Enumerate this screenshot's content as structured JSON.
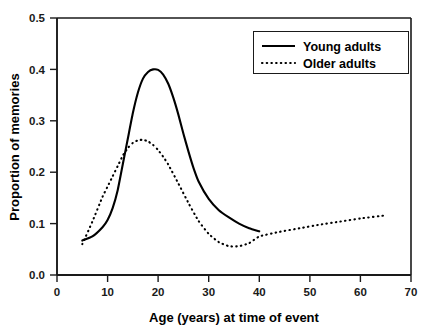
{
  "chart_data": {
    "type": "line",
    "title": "",
    "xlabel": "Age (years) at time of event",
    "ylabel": "Proportion of memories",
    "xlim": [
      0,
      70
    ],
    "ylim": [
      0.0,
      0.5
    ],
    "xticks": [
      0,
      10,
      20,
      30,
      40,
      50,
      60,
      70
    ],
    "xtick_labels": [
      "0",
      "10",
      "20",
      "30",
      "40",
      "50",
      "60",
      "70"
    ],
    "yticks": [
      0.0,
      0.1,
      0.2,
      0.3,
      0.4,
      0.5
    ],
    "ytick_labels": [
      "0.0",
      "0.1",
      "0.2",
      "0.3",
      "0.4",
      "0.5"
    ],
    "grid": false,
    "legend_position": "top-right",
    "series": [
      {
        "name": "Young adults",
        "style": "solid",
        "color": "#000000",
        "x": [
          5,
          7,
          9,
          10,
          11,
          12,
          13,
          14,
          15,
          16,
          17,
          18,
          19,
          20,
          21,
          22,
          23,
          24,
          25,
          26,
          27,
          28,
          30,
          32,
          34,
          36,
          38,
          40
        ],
        "y": [
          0.067,
          0.075,
          0.093,
          0.107,
          0.13,
          0.165,
          0.215,
          0.265,
          0.315,
          0.355,
          0.382,
          0.395,
          0.4,
          0.399,
          0.39,
          0.372,
          0.345,
          0.312,
          0.275,
          0.24,
          0.208,
          0.182,
          0.148,
          0.126,
          0.112,
          0.1,
          0.091,
          0.085
        ]
      },
      {
        "name": "Older adults",
        "style": "dotted",
        "color": "#000000",
        "x": [
          5,
          7,
          9,
          10,
          11,
          12,
          13,
          14,
          15,
          16,
          17,
          18,
          19,
          20,
          21,
          22,
          24,
          26,
          28,
          30,
          32,
          34,
          36,
          38,
          40,
          44,
          48,
          52,
          56,
          60,
          65
        ],
        "y": [
          0.06,
          0.104,
          0.152,
          0.172,
          0.192,
          0.212,
          0.232,
          0.247,
          0.257,
          0.262,
          0.263,
          0.26,
          0.253,
          0.243,
          0.23,
          0.215,
          0.178,
          0.14,
          0.105,
          0.08,
          0.064,
          0.056,
          0.056,
          0.062,
          0.075,
          0.084,
          0.091,
          0.098,
          0.104,
          0.11,
          0.116
        ]
      }
    ],
    "legend": [
      {
        "label": "Young adults",
        "style": "solid"
      },
      {
        "label": "Older adults",
        "style": "dotted"
      }
    ],
    "annotations": []
  }
}
